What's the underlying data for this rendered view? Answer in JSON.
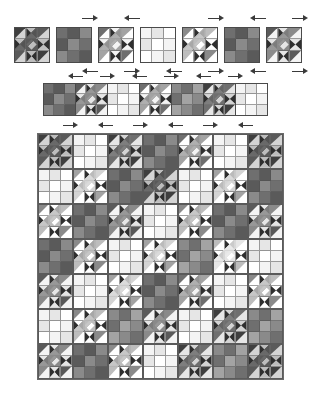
{
  "figure": {
    "background_color": "#ffffff"
  },
  "palette": {
    "v0": "#ffffff",
    "v1": "#f4f4f4",
    "v2": "#e6e6e6",
    "v3": "#d4d4d4",
    "v4": "#bdbdbd",
    "v5": "#a3a3a3",
    "v6": "#8a8a8a",
    "v7": "#6f6f6f",
    "v8": "#5a5a5a",
    "v9": "#3f3f3f",
    "seam_line": "#4a4a4a",
    "arrow_color": "#3a3a3a",
    "paper": "#ffffff"
  },
  "legend": {
    "arrow_meaning": "seam allowance pressing direction",
    "block_types": [
      "star-block",
      "nine-patch-block"
    ]
  },
  "sections": [
    {
      "name": "individual-blocks-row",
      "label": "Step 1 - individual blocks",
      "block_count": 7,
      "block_size_px": 36,
      "gap_px": 6,
      "x": 14,
      "y": 27,
      "blocks": [
        {
          "type": "star",
          "tone": 8,
          "arrow": null
        },
        {
          "type": "ninepatch",
          "tone": 7,
          "arrow": "right"
        },
        {
          "type": "star",
          "tone": 5,
          "arrow": "left"
        },
        {
          "type": "ninepatch",
          "tone": 1,
          "arrow": null
        },
        {
          "type": "star",
          "tone": 4,
          "arrow": "right"
        },
        {
          "type": "ninepatch",
          "tone": 7,
          "arrow": "left"
        },
        {
          "type": "star",
          "tone": 6,
          "arrow": "right"
        }
      ],
      "arrows_above": [
        {
          "after_block": 1,
          "direction": "right"
        },
        {
          "after_block": 2,
          "direction": "left"
        },
        {
          "after_block": 4,
          "direction": "right"
        },
        {
          "after_block": 5,
          "direction": "left"
        },
        {
          "after_block": 6,
          "direction": "right"
        }
      ],
      "arrows_below": [
        {
          "after_block": 1,
          "direction": "left"
        },
        {
          "after_block": 2,
          "direction": "right"
        },
        {
          "after_block": 3,
          "direction": "left"
        },
        {
          "after_block": 4,
          "direction": "right"
        },
        {
          "after_block": 5,
          "direction": "left"
        },
        {
          "after_block": 6,
          "direction": "right"
        }
      ]
    },
    {
      "name": "joined-row-strip",
      "label": "Step 2 - blocks joined into a row",
      "block_count": 7,
      "block_size_px": 33,
      "x": 44,
      "y": 83,
      "blocks": [
        {
          "type": "ninepatch",
          "tone": 7
        },
        {
          "type": "star",
          "tone": 6
        },
        {
          "type": "ninepatch",
          "tone": 1
        },
        {
          "type": "star",
          "tone": 5
        },
        {
          "type": "ninepatch",
          "tone": 6
        },
        {
          "type": "star",
          "tone": 7
        },
        {
          "type": "ninepatch",
          "tone": 1
        }
      ],
      "arrows_above": [
        {
          "index": 0,
          "direction": "left"
        },
        {
          "index": 1,
          "direction": "right"
        },
        {
          "index": 2,
          "direction": "left"
        },
        {
          "index": 3,
          "direction": "right"
        },
        {
          "index": 4,
          "direction": "left"
        },
        {
          "index": 5,
          "direction": "right"
        }
      ]
    },
    {
      "name": "finished-quilt-top",
      "label": "Step 3 - completed quilt top",
      "grid_rows": 7,
      "grid_cols": 7,
      "block_size_px": 35,
      "x": 37,
      "y": 133,
      "arrows_above": [
        {
          "index": 0,
          "direction": "right"
        },
        {
          "index": 1,
          "direction": "left"
        },
        {
          "index": 2,
          "direction": "right"
        },
        {
          "index": 3,
          "direction": "left"
        },
        {
          "index": 4,
          "direction": "right"
        },
        {
          "index": 5,
          "direction": "left"
        }
      ],
      "layout": [
        [
          {
            "type": "star",
            "tone": 8
          },
          {
            "type": "ninepatch",
            "tone": 1
          },
          {
            "type": "star",
            "tone": 7
          },
          {
            "type": "ninepatch",
            "tone": 7
          },
          {
            "type": "star",
            "tone": 5
          },
          {
            "type": "ninepatch",
            "tone": 1
          },
          {
            "type": "star",
            "tone": 8
          }
        ],
        [
          {
            "type": "ninepatch",
            "tone": 1
          },
          {
            "type": "star",
            "tone": 3
          },
          {
            "type": "ninepatch",
            "tone": 7
          },
          {
            "type": "star",
            "tone": 8
          },
          {
            "type": "ninepatch",
            "tone": 1
          },
          {
            "type": "star",
            "tone": 3
          },
          {
            "type": "ninepatch",
            "tone": 7
          }
        ],
        [
          {
            "type": "star",
            "tone": 4
          },
          {
            "type": "ninepatch",
            "tone": 7
          },
          {
            "type": "star",
            "tone": 6
          },
          {
            "type": "ninepatch",
            "tone": 1
          },
          {
            "type": "star",
            "tone": 4
          },
          {
            "type": "ninepatch",
            "tone": 7
          },
          {
            "type": "star",
            "tone": 6
          }
        ],
        [
          {
            "type": "ninepatch",
            "tone": 7
          },
          {
            "type": "star",
            "tone": 4
          },
          {
            "type": "ninepatch",
            "tone": 1
          },
          {
            "type": "star",
            "tone": 3
          },
          {
            "type": "ninepatch",
            "tone": 6
          },
          {
            "type": "star",
            "tone": 2
          },
          {
            "type": "ninepatch",
            "tone": 1
          }
        ],
        [
          {
            "type": "star",
            "tone": 6
          },
          {
            "type": "ninepatch",
            "tone": 1
          },
          {
            "type": "star",
            "tone": 3
          },
          {
            "type": "ninepatch",
            "tone": 7
          },
          {
            "type": "star",
            "tone": 5
          },
          {
            "type": "ninepatch",
            "tone": 1
          },
          {
            "type": "star",
            "tone": 4
          }
        ],
        [
          {
            "type": "ninepatch",
            "tone": 1
          },
          {
            "type": "star",
            "tone": 4
          },
          {
            "type": "ninepatch",
            "tone": 6
          },
          {
            "type": "star",
            "tone": 6
          },
          {
            "type": "ninepatch",
            "tone": 1
          },
          {
            "type": "star",
            "tone": 7
          },
          {
            "type": "ninepatch",
            "tone": 6
          }
        ],
        [
          {
            "type": "star",
            "tone": 6
          },
          {
            "type": "ninepatch",
            "tone": 7
          },
          {
            "type": "star",
            "tone": 4
          },
          {
            "type": "ninepatch",
            "tone": 1
          },
          {
            "type": "star",
            "tone": 7
          },
          {
            "type": "ninepatch",
            "tone": 6
          },
          {
            "type": "star",
            "tone": 8
          }
        ]
      ]
    }
  ]
}
